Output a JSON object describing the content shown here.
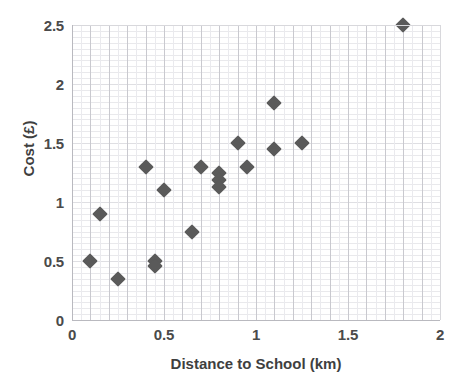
{
  "chart_data": {
    "type": "scatter",
    "title": "",
    "xlabel": "Distance to School (km)",
    "ylabel": "Cost  (£)",
    "xlim": [
      0,
      2
    ],
    "ylim": [
      0,
      2.5
    ],
    "xticks": [
      "0",
      "0.5",
      "1",
      "1.5",
      "2"
    ],
    "xtick_values": [
      0,
      0.5,
      1,
      1.5,
      2
    ],
    "yticks": [
      "0",
      "0.5",
      "1",
      "1.5",
      "2",
      "2.5"
    ],
    "ytick_values": [
      0,
      0.5,
      1,
      1.5,
      2,
      2.5
    ],
    "grid": true,
    "grid_minor": true,
    "legend": "none",
    "marker": "diamond",
    "marker_color": "#5a5a5a",
    "series": [
      {
        "name": "Cost vs Distance",
        "points": [
          {
            "x": 0.1,
            "y": 0.5
          },
          {
            "x": 0.15,
            "y": 0.9
          },
          {
            "x": 0.25,
            "y": 0.35
          },
          {
            "x": 0.4,
            "y": 1.3
          },
          {
            "x": 0.45,
            "y": 0.5
          },
          {
            "x": 0.45,
            "y": 0.46
          },
          {
            "x": 0.5,
            "y": 1.1
          },
          {
            "x": 0.65,
            "y": 0.75
          },
          {
            "x": 0.7,
            "y": 1.3
          },
          {
            "x": 0.8,
            "y": 1.25
          },
          {
            "x": 0.8,
            "y": 1.19
          },
          {
            "x": 0.8,
            "y": 1.13
          },
          {
            "x": 0.9,
            "y": 1.5
          },
          {
            "x": 0.95,
            "y": 1.3
          },
          {
            "x": 1.1,
            "y": 1.84
          },
          {
            "x": 1.1,
            "y": 1.45
          },
          {
            "x": 1.25,
            "y": 1.5
          },
          {
            "x": 1.8,
            "y": 2.5
          }
        ]
      }
    ]
  }
}
